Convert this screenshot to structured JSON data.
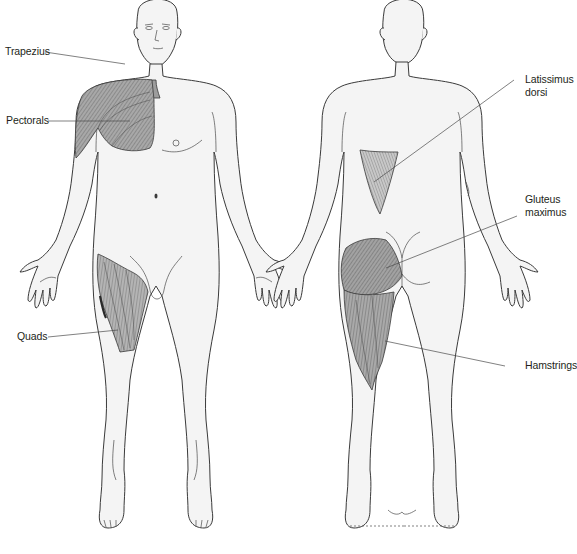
{
  "diagram": {
    "type": "anatomical-muscle-diagram",
    "views": [
      "front",
      "back"
    ],
    "labels": {
      "trapezius": "Trapezius",
      "pectorals": "Pectorals",
      "quads": "Quads",
      "latissimus_line1": "Latissimus",
      "latissimus_line2": "dorsi",
      "gluteus_line1": "Gluteus",
      "gluteus_line2": "maximus",
      "hamstrings": "Hamstrings"
    },
    "bottom_caption_partial": "",
    "colors": {
      "background": "#ffffff",
      "skin": "#f4f4f4",
      "outline": "#3a3a3a",
      "muscle": "#9d9d9d",
      "label_text": "#231f20"
    }
  }
}
